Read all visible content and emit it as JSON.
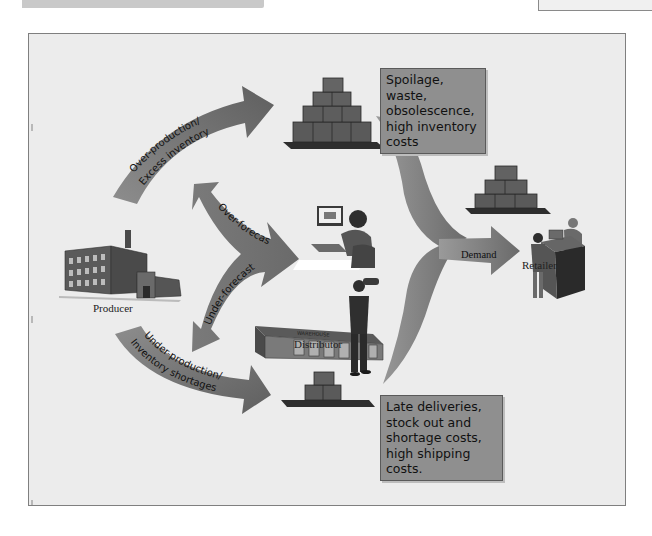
{
  "diagram": {
    "nodes": {
      "producer": "Producer",
      "distributor": "Distributor",
      "retailer": "Retailer"
    },
    "arrows": {
      "over_production": [
        "Over-production/",
        "Excess inventory"
      ],
      "under_production": [
        "Under-production/",
        "Inventory shortages"
      ],
      "over_forecast": "Over-forecast",
      "under_forecast": "Under-forecast",
      "demand": "Demand"
    },
    "notes": {
      "excess": "Spoilage, waste, obsolescence, high inventory costs",
      "shortage": "Late deliveries, stock out and shortage costs, high shipping costs."
    },
    "warehouse_sign": "WAREHOUSE",
    "colors": {
      "background": "#ececec",
      "arrow_gray": "#6f6f6f",
      "note_fill": "#8f8f8f",
      "frame_border": "#7f7f7f"
    }
  }
}
